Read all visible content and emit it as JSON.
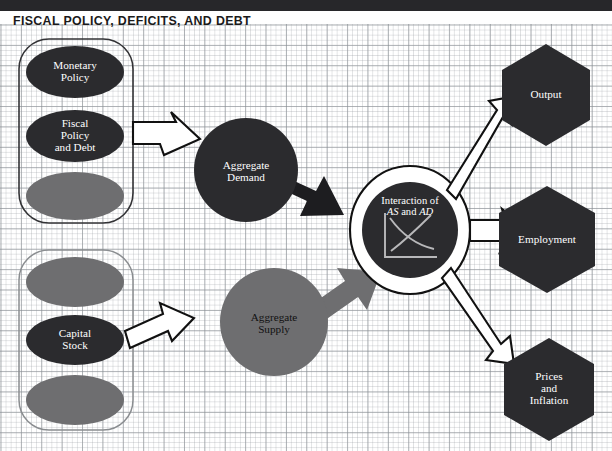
{
  "figure": {
    "title": "FISCAL POLICY, DEFICITS, AND DEBT",
    "colors": {
      "dark_fill": "#2b2b2e",
      "gray_fill": "#6e6e70",
      "top_bar": "#27272a",
      "outline": "#1a1a1a",
      "grid_line": "#787e84",
      "white": "#ffffff"
    }
  },
  "capsules": [
    {
      "name": "policy-capsule",
      "nodes": [
        {
          "label": "Monetary\nPolicy",
          "line1": "Monetary",
          "line2": "Policy",
          "line3": "",
          "style": "dark"
        },
        {
          "label": "Fiscal\nPolicy\nand Debt",
          "line1": "Fiscal",
          "line2": "Policy",
          "line3": "and Debt",
          "style": "dark"
        },
        {
          "label": "",
          "line1": "",
          "line2": "",
          "line3": "",
          "style": "gray"
        }
      ]
    },
    {
      "name": "capital-capsule",
      "nodes": [
        {
          "label": "",
          "line1": "",
          "line2": "",
          "line3": "",
          "style": "gray"
        },
        {
          "label": "Capital\nStock",
          "line1": "Capital",
          "line2": "Stock",
          "line3": "",
          "style": "dark"
        },
        {
          "label": "",
          "line1": "",
          "line2": "",
          "line3": "",
          "style": "gray"
        }
      ]
    }
  ],
  "circles": {
    "aggregate_demand": {
      "line1": "Aggregate",
      "line2": "Demand",
      "style": "dark"
    },
    "aggregate_supply": {
      "line1": "Aggregate",
      "line2": "Supply",
      "style": "gray"
    },
    "interaction": {
      "line1": "Interaction of",
      "line2_a": "AS",
      "line2_b": "and",
      "line2_c": "AD",
      "style": "dark",
      "inline_chart": {
        "type": "line",
        "title": "AS and AD crossing curves",
        "series": [
          {
            "name": "AD",
            "shape": "downward-sloping-convex"
          },
          {
            "name": "AS",
            "shape": "upward-sloping-convex"
          }
        ],
        "xlabel": "",
        "ylabel": "",
        "grid": false
      }
    }
  },
  "hexagons": [
    {
      "name": "output",
      "line1": "Output",
      "line2": "",
      "line3": ""
    },
    {
      "name": "employment",
      "line1": "Employment",
      "line2": "",
      "line3": ""
    },
    {
      "name": "prices-and-inflation",
      "line1": "Prices",
      "line2": "and",
      "line3": "Inflation"
    }
  ],
  "arrows": [
    {
      "name": "policy-to-aggregate-demand",
      "style": "outlined"
    },
    {
      "name": "aggregate-demand-to-interaction",
      "style": "solid-black"
    },
    {
      "name": "capital-stock-to-aggregate-supply",
      "style": "outlined"
    },
    {
      "name": "aggregate-supply-to-interaction",
      "style": "solid-gray"
    },
    {
      "name": "interaction-to-output",
      "style": "outlined"
    },
    {
      "name": "interaction-to-employment",
      "style": "outlined"
    },
    {
      "name": "interaction-to-prices-and-inflation",
      "style": "outlined"
    }
  ]
}
